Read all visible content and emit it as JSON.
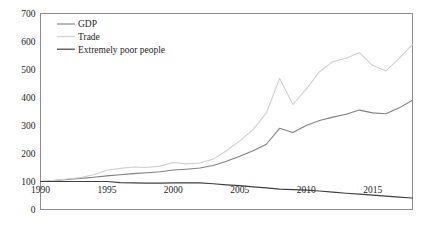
{
  "chart_data": {
    "type": "line",
    "title": "",
    "subtitle": "",
    "xlabel": "",
    "ylabel": "",
    "xlim": [
      1990,
      2018
    ],
    "ylim": [
      0,
      700
    ],
    "ytick_labels": [
      "0",
      "100",
      "200",
      "300",
      "400",
      "500",
      "600",
      "700"
    ],
    "ytick_values": [
      0,
      100,
      200,
      300,
      400,
      500,
      600,
      700
    ],
    "xtick_labels": [
      "1990",
      "1995",
      "2000",
      "2005",
      "2010",
      "2015"
    ],
    "xtick_values": [
      1990,
      1995,
      2000,
      2005,
      2010,
      2015
    ],
    "grid": false,
    "legend_position": "top-left",
    "x": [
      1990,
      1991,
      1992,
      1993,
      1994,
      1995,
      1996,
      1997,
      1998,
      1999,
      2000,
      2001,
      2002,
      2003,
      2004,
      2005,
      2006,
      2007,
      2008,
      2009,
      2010,
      2011,
      2012,
      2013,
      2014,
      2015,
      2016,
      2017,
      2018
    ],
    "series": [
      {
        "name": "GDP",
        "color": "#808080",
        "values": [
          100,
          103,
          107,
          111,
          115,
          120,
          124,
          128,
          131,
          135,
          141,
          144,
          148,
          157,
          172,
          190,
          210,
          233,
          290,
          275,
          300,
          318,
          330,
          340,
          355,
          345,
          342,
          363,
          390
        ]
      },
      {
        "name": "Trade",
        "color": "#cfcfcf",
        "values": [
          100,
          104,
          109,
          114,
          124,
          140,
          147,
          152,
          150,
          155,
          168,
          163,
          166,
          180,
          210,
          245,
          285,
          345,
          468,
          375,
          430,
          492,
          528,
          540,
          560,
          515,
          495,
          540,
          590
        ]
      },
      {
        "name": "Extremely poor people",
        "color": "#404040",
        "values": [
          100,
          100,
          100,
          100,
          100,
          100,
          96,
          95,
          94,
          94,
          95,
          95,
          95,
          92,
          88,
          85,
          81,
          77,
          73,
          71,
          69,
          66,
          62,
          58,
          55,
          51,
          48,
          44,
          41
        ]
      }
    ]
  },
  "legend": {
    "items": [
      {
        "label": "GDP",
        "swatch": "gdp-line-swatch"
      },
      {
        "label": "Trade",
        "swatch": "trade-line-swatch"
      },
      {
        "label": "Extremely poor people",
        "swatch": "poverty-line-swatch"
      }
    ]
  },
  "colors": {
    "gdp": "#808080",
    "trade": "#cfcfcf",
    "poverty": "#404040",
    "frame": "#8c8c8c",
    "text": "#1d1d1d",
    "background": "#ffffff"
  }
}
